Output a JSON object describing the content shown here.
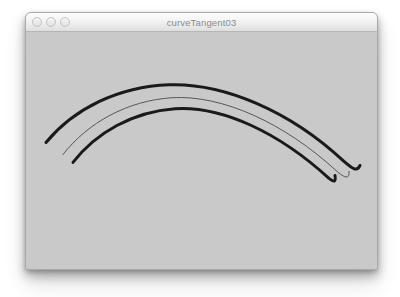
{
  "window": {
    "title": "curveTangent03",
    "state": "inactive",
    "traffic_lights": [
      {
        "name": "close",
        "label": "Close"
      },
      {
        "name": "minimize",
        "label": "Minimize"
      },
      {
        "name": "zoom",
        "label": "Zoom"
      }
    ],
    "colors": {
      "titlebar_top": "#fdfdfd",
      "titlebar_bottom": "#dedede",
      "title_text": "#8b8b8b",
      "canvas_background": "#c9c9c9",
      "window_border": "#a9a9a9",
      "page_background": "#ffffff"
    }
  },
  "canvas": {
    "name": "curve-canvas",
    "width": 351,
    "height": 237,
    "background": "#c9c9c9",
    "curves": [
      {
        "name": "outer-tangent-curve",
        "role": "thick-black-outer",
        "stroke": "#1a1a1a",
        "stroke_width": 3.0,
        "path": "M 20 110 C 48 76, 92 54, 143 52 C 197 50, 264 78, 318 129 C 326 136, 331 140, 334 133",
        "start_point": [
          20,
          110
        ],
        "end_point": [
          334,
          133
        ]
      },
      {
        "name": "middle-tangent-curve",
        "role": "thin-gray-middle",
        "stroke": "#555555",
        "stroke_width": 1.0,
        "path": "M 37 122 C 62 90, 101 68, 146 65 C 196 62, 258 90, 311 139 C 319 146, 324 147, 323 139",
        "start_point": [
          37,
          122
        ],
        "end_point": [
          323,
          139
        ]
      },
      {
        "name": "inner-tangent-curve",
        "role": "thick-black-inner",
        "stroke": "#1a1a1a",
        "stroke_width": 3.0,
        "path": "M 47 130 C 70 100, 107 79, 149 76 C 196 73, 253 100, 303 146 C 308 150, 310 150, 309 143",
        "start_point": [
          47,
          130
        ],
        "end_point": [
          309,
          143
        ]
      }
    ]
  }
}
